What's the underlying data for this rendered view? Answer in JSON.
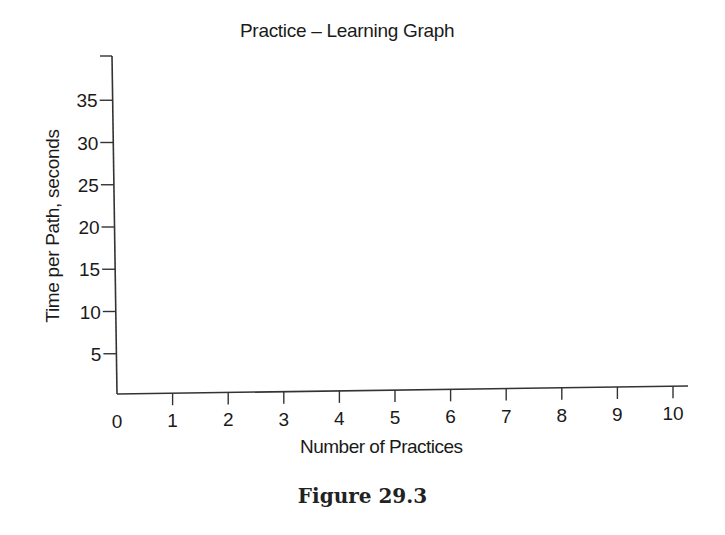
{
  "chart_data": {
    "type": "line",
    "title": "Practice – Learning Graph",
    "xlabel": "Number of Practices",
    "ylabel": "Time per Path, seconds",
    "x_ticks": [
      "0",
      "1",
      "2",
      "3",
      "4",
      "5",
      "6",
      "7",
      "8",
      "9",
      "10"
    ],
    "y_ticks": [
      "5",
      "10",
      "15",
      "20",
      "25",
      "30",
      "35"
    ],
    "xlim": [
      0,
      10
    ],
    "ylim": [
      0,
      40
    ],
    "grid": false,
    "legend": null,
    "series": [],
    "note": "Blank graph template; no data plotted"
  },
  "figure": {
    "caption": "Figure 29.3"
  },
  "colors": {
    "ink": "#1a1a1a",
    "background": "#ffffff"
  }
}
